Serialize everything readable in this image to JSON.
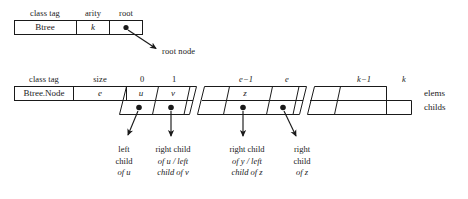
{
  "diagram": {
    "title_absent": "",
    "btree_header": {
      "fields": [
        "class tag",
        "arity",
        "root"
      ],
      "values": [
        "Btree",
        "k",
        "root-pointer-dot"
      ]
    },
    "root_arrow_label": "root node",
    "node_header": {
      "fields": [
        "class tag",
        "size"
      ],
      "values": [
        "Btree.Node",
        "e"
      ]
    },
    "index_labels": [
      "0",
      "1",
      "e−1",
      "e",
      "k−1",
      "k"
    ],
    "elems_values": [
      "u",
      "v",
      "z"
    ],
    "row_labels": {
      "elems": "elems",
      "childs": "childs"
    },
    "captions": [
      {
        "lines": [
          "left",
          "child",
          "of u"
        ]
      },
      {
        "lines": [
          "right child",
          "of u / left",
          "child of v"
        ]
      },
      {
        "lines": [
          "right child",
          "of y / left",
          "child of z"
        ]
      },
      {
        "lines": [
          "right",
          "child",
          "of z"
        ]
      }
    ],
    "colors": {
      "stroke": "#1a1a1a",
      "background": "#ffffff",
      "text": "#1a1a1a"
    }
  }
}
